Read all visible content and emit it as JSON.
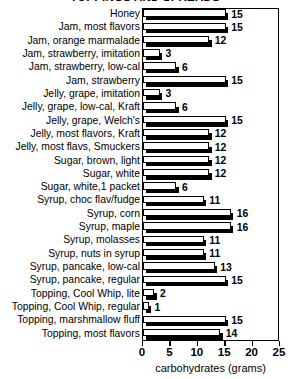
{
  "chart_data": {
    "type": "bar",
    "orientation": "horizontal",
    "title": "TOPPINGS AND SPREADS",
    "xlabel": "carbohydrates (grams)",
    "ylabel": "",
    "xlim": [
      0,
      25
    ],
    "xticks": [
      0,
      5,
      10,
      15,
      20,
      25
    ],
    "xtick_labels": [
      "0",
      "5",
      "10",
      "15",
      "20",
      "25"
    ],
    "grid": false,
    "legend": "none",
    "categories": [
      "Honey",
      "Jam, most flavors",
      "Jam, orange marmalade",
      "Jam, strawberry, imitation",
      "Jam, strawberry, low-cal",
      "Jam, strawberry",
      "Jelly, grape, imitation",
      "Jelly, grape, low-cal, Kraft",
      "Jelly, grape, Welch's",
      "Jelly, most flavors, Kraft",
      "Jelly, most flavs, Smuckers",
      "Sugar, brown, light",
      "Sugar, white",
      "Sugar, white,1 packet",
      "Syrup, choc flav/fudge",
      "Syrup, corn",
      "Syrup, maple",
      "Syrup, molasses",
      "Syrup, nuts in syrup",
      "Syrup, pancake, low-cal",
      "Syrup, pancake, regular",
      "Topping, Cool Whip, lite",
      "Topping, Cool Whip, regular",
      "Topping, marshmallow fluff",
      "Topping, most flavors"
    ],
    "values": [
      15,
      15,
      12,
      3,
      6,
      15,
      3,
      6,
      15,
      12,
      12,
      12,
      12,
      6,
      11,
      16,
      16,
      11,
      11,
      13,
      15,
      2,
      1,
      15,
      14
    ],
    "value_labels": [
      "15",
      "15",
      "12",
      "3",
      "6",
      "15",
      "3",
      "6",
      "15",
      "12",
      "12",
      "12",
      "12",
      "6",
      "11",
      "16",
      "16",
      "11",
      "11",
      "13",
      "15",
      "2",
      "1",
      "15",
      "14"
    ]
  }
}
